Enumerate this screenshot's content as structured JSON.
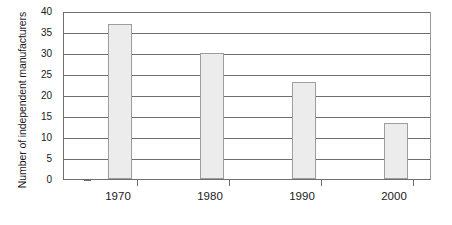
{
  "chart_data": {
    "type": "bar",
    "title": "",
    "xlabel": "",
    "ylabel": "Number of independent manufacturers",
    "categories": [
      "1970",
      "1980",
      "1990",
      "2000"
    ],
    "values": [
      37,
      30,
      23,
      13.3
    ],
    "ylim": [
      0,
      40
    ],
    "yticks": [
      0,
      5,
      10,
      15,
      20,
      25,
      30,
      35,
      40
    ],
    "ytick_labels": [
      "0",
      "5",
      "10",
      "15",
      "20",
      "25",
      "30",
      "35",
      "40"
    ],
    "grid": true,
    "legend": "none",
    "bar_color": "#ececec",
    "bar_border_color": "#9e9e9e",
    "axis_color": "#6e6e6e",
    "text_color": "#1a1a1a",
    "background": "#ffffff"
  }
}
